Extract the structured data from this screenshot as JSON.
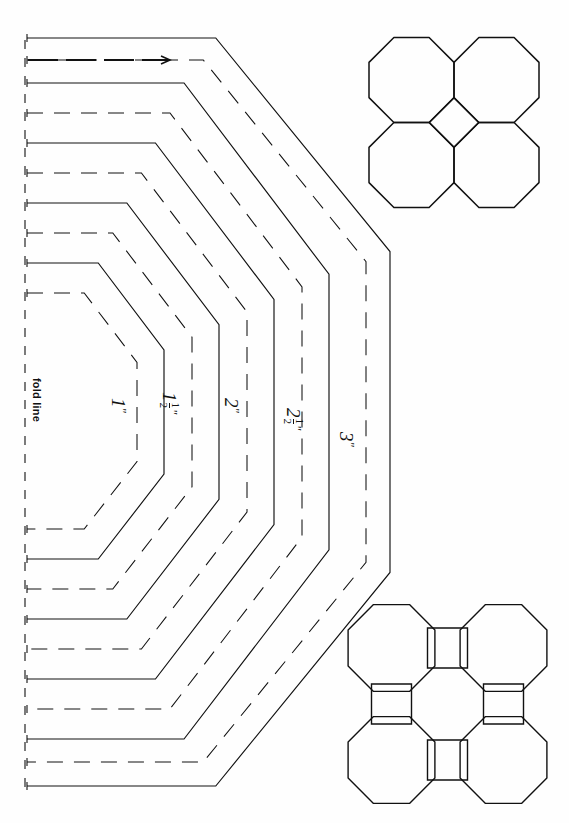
{
  "page": {
    "kind": "scanned-pattern-sheet",
    "background_color": "#fefefe",
    "ink_color": "#111111",
    "width": 569,
    "height": 823
  },
  "fold_line": {
    "label": "fold line",
    "orientation": "vertical",
    "style": "dashed",
    "x": 25,
    "y_top": 40,
    "y_bottom": 790
  },
  "arrow": {
    "name": "direction-arrow",
    "points_to": "right",
    "x_start": 28,
    "x_end": 170,
    "y": 60
  },
  "size_labels": [
    {
      "id": "size-1",
      "whole": "1",
      "num": "",
      "den": "",
      "unit": "\"",
      "x": 130,
      "y": 398
    },
    {
      "id": "size-1-5",
      "whole": "1",
      "num": "1",
      "den": "2",
      "unit": "\"",
      "x": 181,
      "y": 392
    },
    {
      "id": "size-2",
      "whole": "2",
      "num": "",
      "den": "",
      "unit": "\"",
      "x": 243,
      "y": 398
    },
    {
      "id": "size-2-5",
      "whole": "2",
      "num": "1",
      "den": "2",
      "unit": "\"",
      "x": 305,
      "y": 408
    },
    {
      "id": "size-3",
      "whole": "3",
      "num": "",
      "den": "",
      "unit": "\"",
      "x": 358,
      "y": 432
    }
  ],
  "octagon_templates": {
    "description": "Nested right-half octagon outlines radiating from the fold line",
    "count": 11,
    "alternating_styles": [
      "solid",
      "dashed"
    ],
    "rings": [
      {
        "i": 0,
        "style": "dashed",
        "tip_x": 137,
        "half_h": 118,
        "flat_x": 60,
        "top_y": 293,
        "bot_y": 529
      },
      {
        "i": 1,
        "style": "solid",
        "tip_x": 164,
        "half_h": 148,
        "flat_x": 72,
        "top_y": 263,
        "bot_y": 559
      },
      {
        "i": 2,
        "style": "dashed",
        "tip_x": 192,
        "half_h": 178,
        "flat_x": 84,
        "top_y": 233,
        "bot_y": 589
      },
      {
        "i": 3,
        "style": "solid",
        "tip_x": 219,
        "half_h": 208,
        "flat_x": 96,
        "top_y": 203,
        "bot_y": 619
      },
      {
        "i": 4,
        "style": "dashed",
        "tip_x": 247,
        "half_h": 238,
        "flat_x": 108,
        "top_y": 173,
        "bot_y": 649
      },
      {
        "i": 5,
        "style": "solid",
        "tip_x": 274,
        "half_h": 268,
        "flat_x": 120,
        "top_y": 143,
        "bot_y": 679
      },
      {
        "i": 6,
        "style": "dashed",
        "tip_x": 302,
        "half_h": 298,
        "flat_x": 132,
        "top_y": 113,
        "bot_y": 709
      },
      {
        "i": 7,
        "style": "solid",
        "tip_x": 329,
        "half_h": 328,
        "flat_x": 144,
        "top_y": 83,
        "bot_y": 739
      },
      {
        "i": 8,
        "style": "dashed",
        "tip_x": 366,
        "half_h": 358,
        "flat_x": 156,
        "top_y": 60,
        "bot_y": 762
      },
      {
        "i": 9,
        "style": "solid",
        "tip_x": 390,
        "half_h": 382,
        "flat_x": 168,
        "top_y": 38,
        "bot_y": 786
      }
    ]
  },
  "diagrams": [
    {
      "id": "tiling-tight",
      "name": "octagon-square-tiling-tight",
      "caption": "",
      "bounds": {
        "x": 368,
        "y": 30,
        "w": 172,
        "h": 185
      },
      "octagons": 4,
      "squares": 1,
      "note": "Four octagons meeting edge-to-edge with one small rotated square in the centre"
    },
    {
      "id": "tiling-spaced",
      "name": "octagon-square-tiling-spaced",
      "caption": "",
      "bounds": {
        "x": 345,
        "y": 598,
        "w": 205,
        "h": 212
      },
      "octagons": 4,
      "squares": 4,
      "note": "Four octagons separated by four squares set on their edges"
    }
  ]
}
